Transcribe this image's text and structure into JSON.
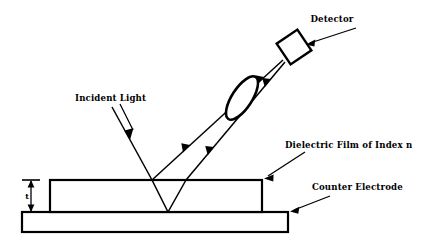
{
  "diagram": {
    "background_color": "#ffffff",
    "ink_color": "#000000",
    "labels": {
      "detector": "Detector",
      "incident_light": "Incident Light",
      "dielectric_film": "Dielectric Film of Index n",
      "counter_electrode": "Counter Electrode",
      "thickness": "t"
    },
    "components": [
      {
        "name": "detector",
        "shape": "rotated-square",
        "label": "Detector",
        "center_x": 294,
        "center_y": 47,
        "size": 25,
        "rotation_deg": -34
      },
      {
        "name": "lens",
        "shape": "ellipse",
        "label": "",
        "center_x": 242,
        "center_y": 98,
        "radius_x": 10,
        "radius_y": 25,
        "rotation_deg": 33
      },
      {
        "name": "dielectric-film",
        "shape": "rectangle",
        "label": "Dielectric Film of Index n",
        "x": 50,
        "y": 180,
        "width": 212,
        "height": 32
      },
      {
        "name": "counter-electrode",
        "shape": "rectangle",
        "label": "Counter Electrode",
        "x": 22,
        "y": 212,
        "width": 266,
        "height": 20
      }
    ],
    "rays": [
      {
        "name": "incident-ray",
        "from_x": 112,
        "from_y": 107,
        "to_x": 152,
        "to_y": 180,
        "arrow_at": "middle",
        "direction": "down-right"
      },
      {
        "name": "refracted-ray-down",
        "from_x": 152,
        "from_y": 180,
        "to_x": 168,
        "to_y": 212,
        "arrow_at": "none",
        "direction": "down-right"
      },
      {
        "name": "internal-reflected-ray-up",
        "from_x": 168,
        "from_y": 212,
        "to_x": 186,
        "to_y": 180,
        "arrow_at": "none",
        "direction": "up-right"
      },
      {
        "name": "surface-reflected-beam",
        "from_x": 152,
        "from_y": 180,
        "to_x": 283,
        "to_y": 60,
        "arrow_at": "two",
        "direction": "up-right"
      },
      {
        "name": "film-reflected-beam",
        "from_x": 186,
        "from_y": 180,
        "to_x": 285,
        "to_y": 62,
        "arrow_at": "two",
        "direction": "up-right"
      }
    ],
    "leaders": [
      {
        "name": "detector-leader",
        "from_x": 356,
        "from_y": 28,
        "to_x": 307,
        "to_y": 44
      },
      {
        "name": "incident-light-leader",
        "from_x": 120,
        "from_y": 104,
        "to_x": 133,
        "to_y": 130
      },
      {
        "name": "dielectric-film-leader",
        "from_x": 305,
        "from_y": 152,
        "to_x": 265,
        "to_y": 178
      },
      {
        "name": "counter-electrode-leader",
        "from_x": 330,
        "from_y": 196,
        "to_x": 291,
        "to_y": 212
      }
    ],
    "dimension": {
      "name": "film-thickness",
      "label": "t",
      "x": 31,
      "top_y": 180,
      "bottom_y": 212,
      "tick_half_width": 9
    },
    "text_positions": {
      "detector": {
        "x": 332,
        "y": 22,
        "anchor": "middle"
      },
      "incident_light": {
        "x": 75,
        "y": 101,
        "anchor": "start"
      },
      "dielectric_film": {
        "x": 285,
        "y": 148,
        "anchor": "start"
      },
      "counter_electrode": {
        "x": 312,
        "y": 190,
        "anchor": "start"
      },
      "thickness": {
        "x": 28,
        "y": 199,
        "anchor": "middle"
      }
    }
  }
}
